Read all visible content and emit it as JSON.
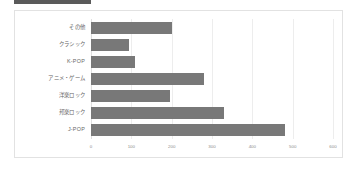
{
  "title_block": {
    "label": "title-bar",
    "color": "#5a5a5a"
  },
  "chart_data": {
    "type": "bar",
    "orientation": "horizontal",
    "title": "",
    "xlabel": "",
    "ylabel": "",
    "categories": [
      "J-POP",
      "邦楽ロック",
      "洋楽ロック",
      "アニメ・ゲーム",
      "K-POP",
      "クラシック",
      "その他"
    ],
    "values": [
      480,
      330,
      195,
      280,
      110,
      95,
      200
    ],
    "series": [
      {
        "name": "回答数",
        "values": [
          480,
          330,
          195,
          280,
          110,
          95,
          200
        ]
      }
    ],
    "display_order_top_to_bottom": [
      "その他",
      "クラシック",
      "K-POP",
      "アニメ・ゲーム",
      "洋楽ロック",
      "邦楽ロック",
      "J-POP"
    ],
    "display_values_top_to_bottom": [
      200,
      95,
      110,
      280,
      195,
      330,
      480
    ],
    "xlim": [
      0,
      600
    ],
    "xticks": [
      0,
      100,
      200,
      300,
      400,
      500,
      600
    ],
    "xtick_labels": [
      "0",
      "100",
      "200",
      "300",
      "400",
      "500",
      "600"
    ],
    "grid": true,
    "legend": false,
    "bar_color": "#787878",
    "grid_color": "#ededed",
    "frame_color": "#e2e2e2",
    "tick_label_color": "#8d8d8d",
    "category_label_color": "#666666"
  }
}
